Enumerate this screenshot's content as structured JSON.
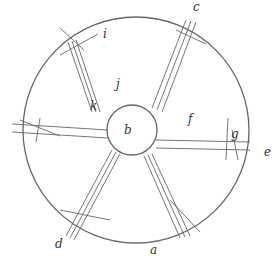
{
  "figure": {
    "outer_circle": {
      "cx": 136,
      "cy": 130,
      "r": 113
    },
    "inner_circle": {
      "cx": 132,
      "cy": 130,
      "r": 25
    },
    "vanes": [
      {
        "x1": 100,
        "y1": 115,
        "x2": 72,
        "y2": 40
      },
      {
        "x1": 160,
        "y1": 112,
        "x2": 192,
        "y2": 12
      },
      {
        "x1": 157,
        "y1": 144,
        "x2": 240,
        "y2": 145
      },
      {
        "x1": 118,
        "y1": 152,
        "x2": 60,
        "y2": 237
      },
      {
        "x1": 148,
        "y1": 156,
        "x2": 185,
        "y2": 237
      },
      {
        "x1": 107,
        "y1": 135,
        "x2": 10,
        "y2": 130
      }
    ]
  },
  "labels": {
    "a": {
      "text": "a",
      "x": 152,
      "y": 253
    },
    "b": {
      "text": "b",
      "x": 127,
      "y": 130
    },
    "c": {
      "text": "c",
      "x": 192,
      "y": 10
    },
    "d": {
      "text": "d",
      "x": 58,
      "y": 248
    },
    "e": {
      "text": "e",
      "x": 266,
      "y": 153
    },
    "f": {
      "text": "f",
      "x": 189,
      "y": 120
    },
    "g": {
      "text": "g",
      "x": 232,
      "y": 135
    },
    "i": {
      "text": "i",
      "x": 104,
      "y": 36
    },
    "j": {
      "text": "j",
      "x": 119,
      "y": 86
    },
    "k": {
      "text": "k",
      "x": 92,
      "y": 106
    }
  }
}
